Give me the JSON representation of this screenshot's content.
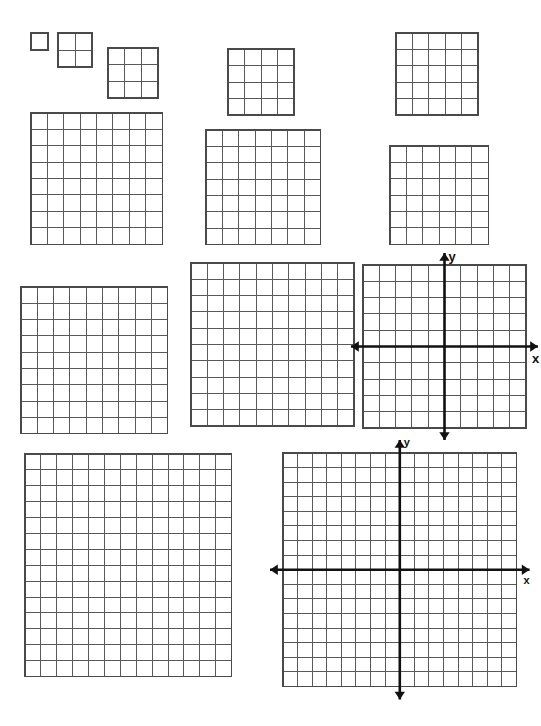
{
  "page": {
    "width": 541,
    "height": 726,
    "background_color": "#ffffff",
    "grid_line_color": "#595959",
    "grid_border_color": "#4a4a4a",
    "axis_color": "#111111"
  },
  "grids": [
    {
      "name": "grid-1x1",
      "label": "1 by 1 grid",
      "cols": 1,
      "rows": 1,
      "cell": 17,
      "x": 31,
      "y": 33,
      "type": "plain"
    },
    {
      "name": "grid-2x2",
      "label": "2 by 2 grid",
      "cols": 2,
      "rows": 2,
      "cell": 17,
      "x": 58,
      "y": 33,
      "type": "plain"
    },
    {
      "name": "grid-3x3",
      "label": "3 by 3 grid",
      "cols": 3,
      "rows": 3,
      "cell": 16.7,
      "x": 108,
      "y": 48,
      "type": "plain"
    },
    {
      "name": "grid-4x4",
      "label": "4 by 4 grid",
      "cols": 4,
      "rows": 4,
      "cell": 16.5,
      "x": 228,
      "y": 49,
      "type": "plain"
    },
    {
      "name": "grid-5x5",
      "label": "5 by 5 grid",
      "cols": 5,
      "rows": 5,
      "cell": 16.4,
      "x": 396,
      "y": 33,
      "type": "plain"
    },
    {
      "name": "grid-8x8",
      "label": "8 by 8 grid",
      "cols": 8,
      "rows": 8,
      "cell": 16.4,
      "x": 31,
      "y": 113,
      "type": "plain"
    },
    {
      "name": "grid-7x7",
      "label": "7 by 7 grid",
      "cols": 7,
      "rows": 7,
      "cell": 16.4,
      "x": 206,
      "y": 130,
      "type": "plain"
    },
    {
      "name": "grid-6x6",
      "label": "6 by 6 grid",
      "cols": 6,
      "rows": 6,
      "cell": 16.4,
      "x": 390,
      "y": 146,
      "type": "plain"
    },
    {
      "name": "grid-9x9",
      "label": "9 by 9 grid",
      "cols": 9,
      "rows": 9,
      "cell": 16.3,
      "x": 21,
      "y": 287,
      "type": "plain"
    },
    {
      "name": "grid-10x10",
      "label": "10 by 10 grid",
      "cols": 10,
      "rows": 10,
      "cell": 16.3,
      "x": 191,
      "y": 263,
      "type": "plain"
    },
    {
      "name": "coordinate-plane-10x10",
      "label": "10 by 10 coordinate plane",
      "cols": 10,
      "rows": 10,
      "cell": 16.3,
      "x": 363,
      "y": 265,
      "type": "axes",
      "axis_x_label": "x",
      "axis_y_label": "y",
      "arrow_overhang": 12
    },
    {
      "name": "grid-14x13",
      "label": "14 row by 13 column grid",
      "cols": 13,
      "rows": 14,
      "cell": 15.9,
      "x": 25,
      "y": 454,
      "type": "plain"
    },
    {
      "name": "coordinate-plane-16x16",
      "label": "16 by 16 coordinate plane",
      "cols": 16,
      "rows": 16,
      "cell": 14.6,
      "x": 283,
      "y": 453,
      "type": "axes",
      "axis_x_label": "x",
      "axis_y_label": "y",
      "arrow_overhang": 13
    }
  ]
}
